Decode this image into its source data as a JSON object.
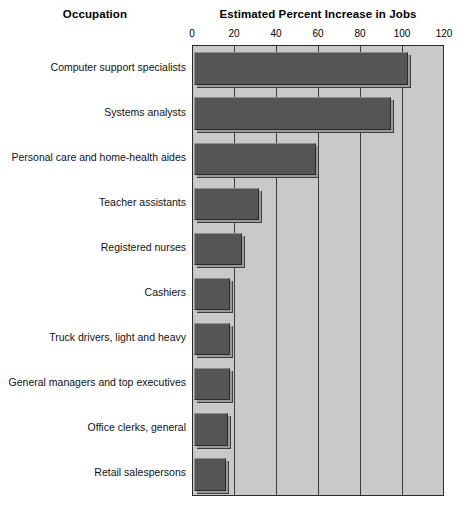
{
  "header": {
    "occupation_label": "Occupation",
    "value_label": "Estimated Percent Increase in Jobs"
  },
  "chart_data": {
    "type": "bar",
    "orientation": "horizontal",
    "title": "Estimated Percent Increase in Jobs",
    "xlabel": "Estimated Percent Increase in Jobs",
    "ylabel": "Occupation",
    "xlim": [
      0,
      120
    ],
    "xticks": [
      0,
      20,
      40,
      60,
      80,
      100,
      120
    ],
    "xticklabels": [
      "0",
      "20",
      "40",
      "60",
      "80",
      "100",
      "120"
    ],
    "grid": true,
    "legend": "none",
    "categories": [
      "Computer support specialists",
      "Systems analysts",
      "Personal care and home-health aides",
      "Teacher assistants",
      "Registered nurses",
      "Cashiers",
      "Truck drivers, light and heavy",
      "General managers and top executives",
      "Office clerks, general",
      "Retail salespersons"
    ],
    "values": [
      102,
      94,
      58,
      31,
      23,
      17,
      17,
      17,
      16,
      15
    ],
    "colors": {
      "bar_fill": "#555555",
      "bar_shadow": "#9a9a9a",
      "plot_background": "#c9c9c9",
      "axis_line": "#2b2b2b",
      "page_background": "#ffffff",
      "text": "#000000"
    }
  }
}
